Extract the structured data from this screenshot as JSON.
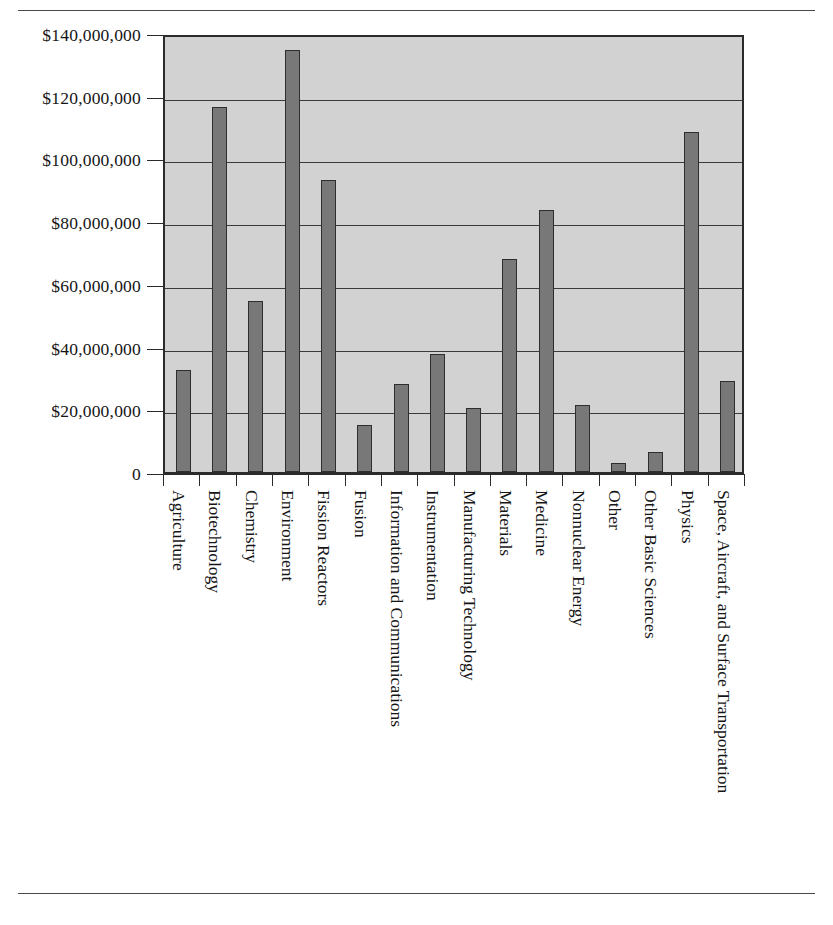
{
  "chart_data": {
    "type": "bar",
    "title": "",
    "subtitle": "",
    "xlabel": "",
    "ylabel": "",
    "ylim": [
      0,
      140000000
    ],
    "grid": true,
    "legend": false,
    "legend_position": "none",
    "y_tick_labels": [
      "$140,000,000",
      "$120,000,000",
      "$100,000,000",
      "$80,000,000",
      "$60,000,000",
      "$40,000,000",
      "$20,000,000",
      "0"
    ],
    "y_tick_values": [
      140000000,
      120000000,
      100000000,
      80000000,
      60000000,
      40000000,
      20000000,
      0
    ],
    "categories": [
      "Agriculture",
      "Biotechnology",
      "Chemistry",
      "Environment",
      "Fission Reactors",
      "Fusion",
      "Information and Communications",
      "Instrumentation",
      "Manufacturing Technology",
      "Materials",
      "Medicine",
      "Nonnuclear Energy",
      "Other",
      "Other Basic Sciences",
      "Physics",
      "Space, Aircraft, and Surface Transportation"
    ],
    "values": [
      32500000,
      116500000,
      54500000,
      134500000,
      93000000,
      15000000,
      28000000,
      37500000,
      20500000,
      68000000,
      83500000,
      21500000,
      3000000,
      6500000,
      108500000,
      29000000
    ]
  },
  "style": {
    "bar_fill": "#787878",
    "bar_stroke": "#2e2e2e",
    "plot_background": "#d2d2d2",
    "axis_color": "#2b2b2b",
    "grid_color": "#3a3a3a",
    "text_color": "#151515",
    "rule_color": "#4a4a4a"
  }
}
